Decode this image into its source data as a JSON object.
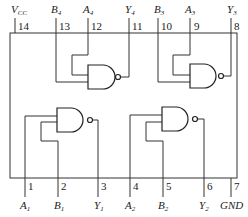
{
  "diagram": {
    "top_pins": [
      {
        "num": "14",
        "name": "V",
        "sub": "CC"
      },
      {
        "num": "13",
        "name": "B",
        "sub": "4"
      },
      {
        "num": "12",
        "name": "A",
        "sub": "4"
      },
      {
        "num": "11",
        "name": "Y",
        "sub": "4"
      },
      {
        "num": "10",
        "name": "B",
        "sub": "3"
      },
      {
        "num": "9",
        "name": "A",
        "sub": "3"
      },
      {
        "num": "8",
        "name": "Y",
        "sub": "3"
      }
    ],
    "bottom_pins": [
      {
        "num": "1",
        "name": "A",
        "sub": "1"
      },
      {
        "num": "2",
        "name": "B",
        "sub": "1"
      },
      {
        "num": "3",
        "name": "Y",
        "sub": "1"
      },
      {
        "num": "4",
        "name": "A",
        "sub": "2"
      },
      {
        "num": "5",
        "name": "B",
        "sub": "2"
      },
      {
        "num": "6",
        "name": "Y",
        "sub": "2"
      },
      {
        "num": "7",
        "name": "GND",
        "sub": ""
      }
    ],
    "gates": [
      "NAND 1",
      "NAND 2",
      "NAND 3",
      "NAND 4"
    ]
  }
}
